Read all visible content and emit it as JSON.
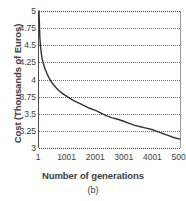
{
  "chart_data": {
    "type": "line",
    "title": "",
    "caption": "(b)",
    "xlabel": "Number of generations",
    "ylabel": "Cost (Thousands of Euros)",
    "xlim": [
      1,
      5001
    ],
    "ylim": [
      3,
      5
    ],
    "grid": true,
    "legend": null,
    "xticks": [
      {
        "label": "1",
        "value": 1
      },
      {
        "label": "1001",
        "value": 1001
      },
      {
        "label": "2001",
        "value": 2001
      },
      {
        "label": "3001",
        "value": 3001
      },
      {
        "label": "4001",
        "value": 4001
      },
      {
        "label": "5001",
        "value": 5001
      }
    ],
    "yticks": [
      {
        "label": "5",
        "value": 5
      },
      {
        "label": "4.75",
        "value": 4.75
      },
      {
        "label": "4.5",
        "value": 4.5
      },
      {
        "label": "4.25",
        "value": 4.25
      },
      {
        "label": "4",
        "value": 4
      },
      {
        "label": "3.75",
        "value": 3.75
      },
      {
        "label": "3.5",
        "value": 3.5
      },
      {
        "label": "3.25",
        "value": 3.25
      },
      {
        "label": "3",
        "value": 3
      }
    ],
    "series": [
      {
        "name": "Cost",
        "color": "#333333",
        "x": [
          1,
          30,
          60,
          100,
          150,
          210,
          280,
          360,
          450,
          560,
          700,
          850,
          1001,
          1200,
          1400,
          1600,
          1800,
          2001,
          2200,
          2400,
          2600,
          2800,
          3001,
          3200,
          3400,
          3600,
          3800,
          4001,
          4200,
          4400,
          4600,
          4800,
          5001
        ],
        "y": [
          5.0,
          4.62,
          4.46,
          4.33,
          4.24,
          4.16,
          4.09,
          4.02,
          3.96,
          3.9,
          3.84,
          3.79,
          3.75,
          3.7,
          3.66,
          3.62,
          3.58,
          3.55,
          3.51,
          3.47,
          3.44,
          3.42,
          3.39,
          3.36,
          3.33,
          3.31,
          3.29,
          3.27,
          3.24,
          3.21,
          3.18,
          3.15,
          3.13
        ]
      }
    ]
  }
}
